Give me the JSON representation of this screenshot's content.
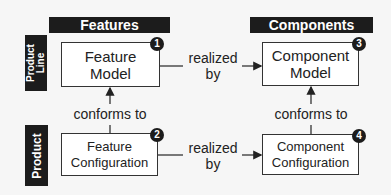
{
  "columns": {
    "features": {
      "title": "Features"
    },
    "components": {
      "title": "Components"
    }
  },
  "rows": {
    "product_line": {
      "label_line1": "Product",
      "label_line2": "Line"
    },
    "product": {
      "label": "Product"
    }
  },
  "nodes": [
    {
      "id": 1,
      "badge": "1",
      "line1": "Feature",
      "line2": "Model"
    },
    {
      "id": 2,
      "badge": "2",
      "line1": "Feature",
      "line2": "Configuration"
    },
    {
      "id": 3,
      "badge": "3",
      "line1": "Component",
      "line2": "Model"
    },
    {
      "id": 4,
      "badge": "4",
      "line1": "Component",
      "line2": "Configuration"
    }
  ],
  "edges": {
    "realized_top": {
      "line1": "realized",
      "line2": "by",
      "from": 1,
      "to": 3
    },
    "realized_bottom": {
      "line1": "realized",
      "line2": "by",
      "from": 2,
      "to": 4
    },
    "conforms_left": {
      "text": "conforms to",
      "from": 2,
      "to": 1
    },
    "conforms_right": {
      "text": "conforms to",
      "from": 4,
      "to": 3
    }
  },
  "colors": {
    "dark": "#1c1c1c",
    "line": "#333333",
    "background": "#f6f6f6",
    "box": "#ffffff"
  }
}
